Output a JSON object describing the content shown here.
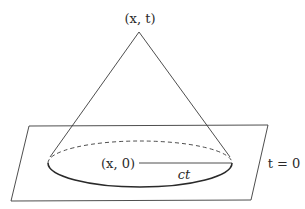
{
  "diagram": {
    "apex_label": "(x, t)",
    "center_label": "(x, 0)",
    "radius_label": "ct",
    "plane_label": "t = 0",
    "stroke_color": "#3a3a3a"
  }
}
